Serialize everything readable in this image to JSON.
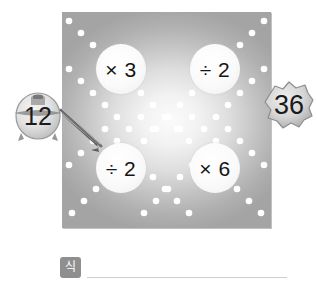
{
  "puzzle": {
    "start_value": "12",
    "end_value": "36",
    "operations": [
      {
        "position": "top-left",
        "label": "× 3"
      },
      {
        "position": "top-right",
        "label": "÷ 2"
      },
      {
        "position": "bottom-left",
        "label": "÷ 2"
      },
      {
        "position": "bottom-right",
        "label": "× 6"
      }
    ],
    "pointer_icon": "arrow-pointer-icon",
    "start_badge_icon": "number-blob-icon",
    "end_badge_icon": "number-blob-icon",
    "dot_color": "#ffffff",
    "panel_edge_color": "#a4a4a4",
    "panel_center_color": "#fbfbfb"
  },
  "answer": {
    "tag_label": "식",
    "value": "",
    "placeholder": ""
  }
}
